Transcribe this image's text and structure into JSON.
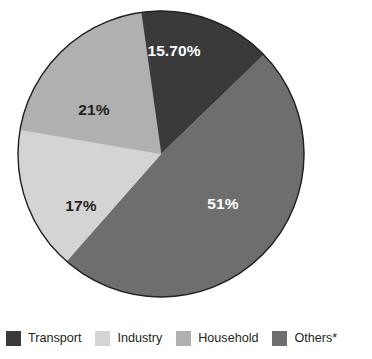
{
  "chart_data": {
    "type": "pie",
    "title": "",
    "subtitle": "",
    "xlabel": "",
    "ylabel": "",
    "legend_position": "bottom",
    "grid": false,
    "start_angle_deg": -98,
    "direction": "clockwise",
    "center": {
      "x": 161,
      "y": 154
    },
    "radius": 143,
    "categories": [
      "Transport",
      "Industry",
      "Household",
      "Others*"
    ],
    "values": [
      15.7,
      17,
      21,
      51
    ],
    "value_labels": [
      "15.70%",
      "17%",
      "21%",
      "51%"
    ],
    "colors": [
      "#3a3a3a",
      "#d4d4d4",
      "#b0b0b0",
      "#6e6e6e"
    ],
    "slices": [
      {
        "name": "Transport",
        "value": 15.7,
        "label": "15.70%",
        "color": "#3a3a3a",
        "label_color": "#ffffff",
        "label_x": 174,
        "label_y": 52
      },
      {
        "name": "Others*",
        "value": 51,
        "label": "51%",
        "color": "#6e6e6e",
        "label_color": "#ffffff",
        "label_x": 223,
        "label_y": 205
      },
      {
        "name": "Industry",
        "value": 17,
        "label": "17%",
        "color": "#d4d4d4",
        "label_color": "#231f20",
        "label_x": 81,
        "label_y": 207
      },
      {
        "name": "Household",
        "value": 21,
        "label": "21%",
        "color": "#b0b0b0",
        "label_color": "#231f20",
        "label_x": 94,
        "label_y": 111
      }
    ]
  },
  "legend": {
    "items": [
      {
        "label": "Transport",
        "color": "#3a3a3a"
      },
      {
        "label": "Industry",
        "color": "#d4d4d4"
      },
      {
        "label": "Household",
        "color": "#b0b0b0"
      },
      {
        "label": "Others*",
        "color": "#6e6e6e"
      }
    ]
  },
  "style": {
    "background": "#ffffff",
    "outline": "#231f20",
    "text": "#231f20"
  }
}
